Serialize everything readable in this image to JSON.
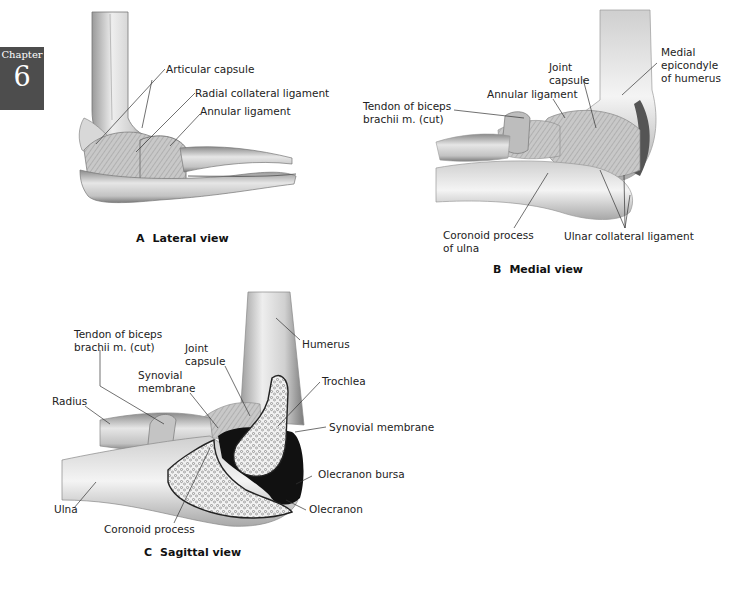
{
  "chapter_tab": {
    "word": "Chapter",
    "number": "6",
    "color": "#4d4d4d"
  },
  "figure": {
    "panel_a": {
      "letter": "A",
      "title": "Lateral view",
      "labels": {
        "articular_capsule": "Articular capsule",
        "radial_collateral_ligament": "Radial collateral ligament",
        "annular_ligament": "Annular ligament"
      }
    },
    "panel_b": {
      "letter": "B",
      "title": "Medial view",
      "labels": {
        "joint_capsule_1": "Joint",
        "joint_capsule_2": "capsule",
        "medial_epicondyle_1": "Medial",
        "medial_epicondyle_2": "epicondyle",
        "medial_epicondyle_3": "of humerus",
        "tendon_biceps_1": "Tendon of biceps",
        "tendon_biceps_2": "brachii m. (cut)",
        "annular_ligament": "Annular ligament",
        "coronoid_process_1": "Coronoid process",
        "coronoid_process_2": "of ulna",
        "ulnar_collateral_ligament": "Ulnar collateral ligament"
      }
    },
    "panel_c": {
      "letter": "C",
      "title": "Sagittal view",
      "labels": {
        "tendon_biceps_1": "Tendon of biceps",
        "tendon_biceps_2": "brachii m. (cut)",
        "joint_capsule_1": "Joint",
        "joint_capsule_2": "capsule",
        "humerus": "Humerus",
        "synovial_membrane_left_1": "Synovial",
        "synovial_membrane_left_2": "membrane",
        "trochlea": "Trochlea",
        "radius": "Radius",
        "synovial_membrane_right": "Synovial membrane",
        "olecranon_bursa": "Olecranon bursa",
        "ulna": "Ulna",
        "olecranon": "Olecranon",
        "coronoid_process": "Coronoid process"
      }
    }
  }
}
